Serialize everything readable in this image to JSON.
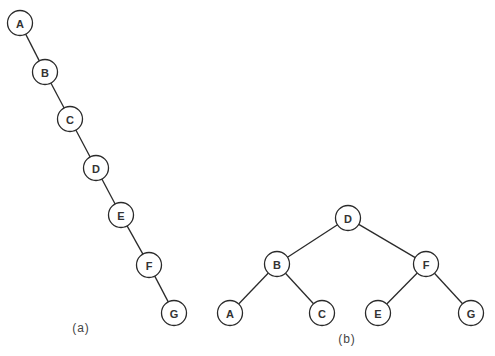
{
  "diagram": {
    "node_radius": 12.5,
    "colors": {
      "stroke": "#2a2a2a",
      "text": "#333333",
      "background": "#ffffff"
    },
    "trees": [
      {
        "id": "a",
        "caption": "(a)",
        "caption_pos": {
          "x": 81,
          "y": 328
        },
        "description": "Degenerate (right-skewed) binary search tree",
        "nodes": [
          {
            "id": "A",
            "label": "A",
            "x": 20,
            "y": 23
          },
          {
            "id": "B",
            "label": "B",
            "x": 45,
            "y": 72
          },
          {
            "id": "C",
            "label": "C",
            "x": 70,
            "y": 119
          },
          {
            "id": "D",
            "label": "D",
            "x": 96,
            "y": 168
          },
          {
            "id": "E",
            "label": "E",
            "x": 121,
            "y": 215
          },
          {
            "id": "F",
            "label": "F",
            "x": 149,
            "y": 265
          },
          {
            "id": "G",
            "label": "G",
            "x": 174,
            "y": 313
          }
        ],
        "edges": [
          [
            "A",
            "B"
          ],
          [
            "B",
            "C"
          ],
          [
            "C",
            "D"
          ],
          [
            "D",
            "E"
          ],
          [
            "E",
            "F"
          ],
          [
            "F",
            "G"
          ]
        ]
      },
      {
        "id": "b",
        "caption": "(b)",
        "caption_pos": {
          "x": 347,
          "y": 339
        },
        "description": "Balanced binary search tree",
        "nodes": [
          {
            "id": "D",
            "label": "D",
            "x": 348,
            "y": 218
          },
          {
            "id": "B",
            "label": "B",
            "x": 277,
            "y": 264
          },
          {
            "id": "F",
            "label": "F",
            "x": 426,
            "y": 264
          },
          {
            "id": "A",
            "label": "A",
            "x": 230,
            "y": 313
          },
          {
            "id": "C",
            "label": "C",
            "x": 322,
            "y": 313
          },
          {
            "id": "E",
            "label": "E",
            "x": 378,
            "y": 313
          },
          {
            "id": "G",
            "label": "G",
            "x": 471,
            "y": 313
          }
        ],
        "edges": [
          [
            "D",
            "B"
          ],
          [
            "D",
            "F"
          ],
          [
            "B",
            "A"
          ],
          [
            "B",
            "C"
          ],
          [
            "F",
            "E"
          ],
          [
            "F",
            "G"
          ]
        ]
      }
    ]
  }
}
